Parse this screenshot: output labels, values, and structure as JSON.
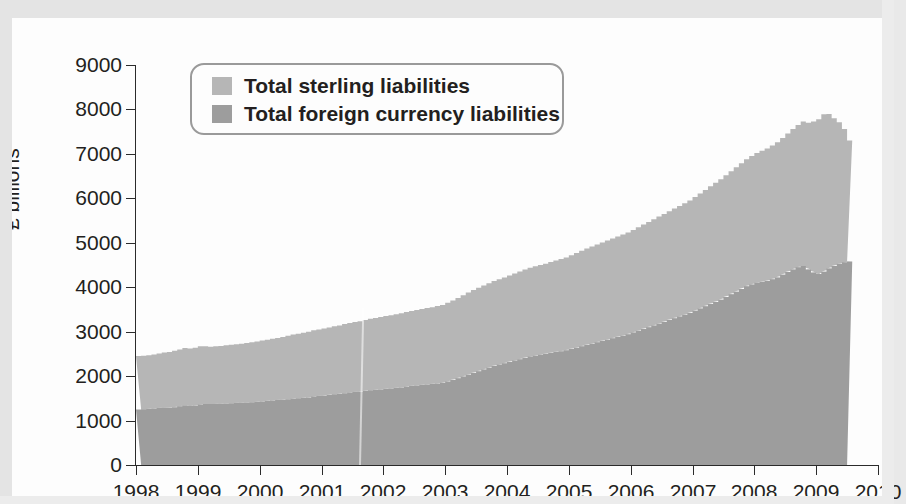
{
  "axes": {
    "y_title": "£ billions",
    "y_ticks": [
      "9000",
      "8000",
      "7000",
      "6000",
      "5000",
      "4000",
      "3000",
      "2000",
      "1000",
      "0"
    ],
    "x_ticks": [
      "1998",
      "1999",
      "2000",
      "2001",
      "2002",
      "2003",
      "2004",
      "2005",
      "2006",
      "2007",
      "2008",
      "2009",
      "2010"
    ]
  },
  "legend": {
    "items": [
      {
        "label": "Total sterling liabilities",
        "color": "#b6b6b6",
        "swatch_name": "legend-swatch-sterling"
      },
      {
        "label": "Total foreign currency liabilities",
        "color": "#9d9d9d",
        "swatch_name": "legend-swatch-foreign"
      }
    ]
  },
  "colors": {
    "sterling": "#b6b6b6",
    "foreign": "#9d9d9d",
    "axis": "#2b2b2b",
    "text": "#231f20",
    "card": "#fdfdfd",
    "page": "#e6e6e6",
    "legend_border": "#9a9a9a"
  },
  "chart_data": {
    "type": "area",
    "title": "",
    "subtitle": "",
    "xlabel": "",
    "ylabel": "£ billions",
    "xlim": [
      1998,
      2010
    ],
    "ylim": [
      0,
      9000
    ],
    "grid": false,
    "legend_position": "top-left",
    "stacked": true,
    "note": "Stacked monthly series; foreign currency liabilities drawn at bottom, sterling liabilities stacked above. Values in £ billions.",
    "x": [
      1998.0,
      1998.083,
      1998.167,
      1998.25,
      1998.333,
      1998.417,
      1998.5,
      1998.583,
      1998.667,
      1998.75,
      1998.833,
      1998.917,
      1999.0,
      1999.083,
      1999.167,
      1999.25,
      1999.333,
      1999.417,
      1999.5,
      1999.583,
      1999.667,
      1999.75,
      1999.833,
      1999.917,
      2000.0,
      2000.083,
      2000.167,
      2000.25,
      2000.333,
      2000.417,
      2000.5,
      2000.583,
      2000.667,
      2000.75,
      2000.833,
      2000.917,
      2001.0,
      2001.083,
      2001.167,
      2001.25,
      2001.333,
      2001.417,
      2001.5,
      2001.583,
      2001.667,
      2001.75,
      2001.833,
      2001.917,
      2002.0,
      2002.083,
      2002.167,
      2002.25,
      2002.333,
      2002.417,
      2002.5,
      2002.583,
      2002.667,
      2002.75,
      2002.833,
      2002.917,
      2003.0,
      2003.083,
      2003.167,
      2003.25,
      2003.333,
      2003.417,
      2003.5,
      2003.583,
      2003.667,
      2003.75,
      2003.833,
      2003.917,
      2004.0,
      2004.083,
      2004.167,
      2004.25,
      2004.333,
      2004.417,
      2004.5,
      2004.583,
      2004.667,
      2004.75,
      2004.833,
      2004.917,
      2005.0,
      2005.083,
      2005.167,
      2005.25,
      2005.333,
      2005.417,
      2005.5,
      2005.583,
      2005.667,
      2005.75,
      2005.833,
      2005.917,
      2006.0,
      2006.083,
      2006.167,
      2006.25,
      2006.333,
      2006.417,
      2006.5,
      2006.583,
      2006.667,
      2006.75,
      2006.833,
      2006.917,
      2007.0,
      2007.083,
      2007.167,
      2007.25,
      2007.333,
      2007.417,
      2007.5,
      2007.583,
      2007.667,
      2007.75,
      2007.833,
      2007.917,
      2008.0,
      2008.083,
      2008.167,
      2008.25,
      2008.333,
      2008.417,
      2008.5,
      2008.583,
      2008.667,
      2008.75,
      2008.833,
      2008.917,
      2009.0,
      2009.083,
      2009.167,
      2009.25,
      2009.333,
      2009.417,
      2009.5
    ],
    "series": [
      {
        "name": "Total foreign currency liabilities",
        "color": "#9d9d9d",
        "values": [
          1250,
          1255,
          1260,
          1270,
          1280,
          1290,
          1290,
          1300,
          1320,
          1340,
          1330,
          1340,
          1360,
          1370,
          1370,
          1375,
          1380,
          1385,
          1390,
          1395,
          1400,
          1405,
          1410,
          1420,
          1430,
          1440,
          1450,
          1460,
          1470,
          1480,
          1490,
          1500,
          1510,
          1520,
          1540,
          1550,
          1560,
          1575,
          1590,
          1600,
          1615,
          1630,
          1640,
          1650,
          1665,
          1680,
          1690,
          1700,
          1710,
          1720,
          1730,
          1745,
          1760,
          1775,
          1790,
          1800,
          1810,
          1820,
          1835,
          1850,
          1880,
          1910,
          1950,
          1990,
          2030,
          2070,
          2110,
          2150,
          2190,
          2230,
          2260,
          2290,
          2320,
          2350,
          2380,
          2410,
          2440,
          2460,
          2480,
          2500,
          2520,
          2540,
          2560,
          2580,
          2610,
          2640,
          2670,
          2700,
          2730,
          2760,
          2790,
          2820,
          2850,
          2880,
          2910,
          2940,
          2980,
          3020,
          3060,
          3100,
          3140,
          3180,
          3220,
          3260,
          3300,
          3340,
          3380,
          3420,
          3470,
          3520,
          3570,
          3620,
          3670,
          3720,
          3780,
          3840,
          3900,
          3960,
          4020,
          4060,
          4100,
          4120,
          4140,
          4180,
          4220,
          4280,
          4340,
          4400,
          4450,
          4480,
          4400,
          4330,
          4300,
          4350,
          4420,
          4480,
          4530,
          4560,
          4580
        ]
      },
      {
        "name": "Total sterling liabilities",
        "color": "#b6b6b6",
        "values": [
          1200,
          1205,
          1210,
          1215,
          1230,
          1240,
          1250,
          1270,
          1280,
          1290,
          1290,
          1300,
          1310,
          1300,
          1290,
          1295,
          1300,
          1310,
          1315,
          1320,
          1330,
          1340,
          1350,
          1360,
          1370,
          1380,
          1390,
          1400,
          1410,
          1430,
          1445,
          1455,
          1465,
          1480,
          1490,
          1500,
          1510,
          1520,
          1530,
          1540,
          1555,
          1565,
          1575,
          1585,
          1600,
          1610,
          1620,
          1630,
          1640,
          1650,
          1660,
          1670,
          1680,
          1690,
          1700,
          1710,
          1720,
          1730,
          1740,
          1750,
          1770,
          1790,
          1810,
          1830,
          1850,
          1870,
          1880,
          1890,
          1900,
          1910,
          1920,
          1930,
          1945,
          1960,
          1975,
          1990,
          2000,
          2010,
          2020,
          2030,
          2045,
          2060,
          2075,
          2090,
          2110,
          2130,
          2150,
          2170,
          2185,
          2200,
          2215,
          2230,
          2245,
          2260,
          2275,
          2290,
          2310,
          2330,
          2350,
          2370,
          2390,
          2410,
          2430,
          2450,
          2470,
          2490,
          2510,
          2530,
          2560,
          2590,
          2620,
          2650,
          2680,
          2710,
          2740,
          2770,
          2800,
          2830,
          2860,
          2890,
          2920,
          2950,
          2980,
          3010,
          3040,
          3080,
          3120,
          3160,
          3200,
          3250,
          3300,
          3400,
          3480,
          3540,
          3480,
          3320,
          3180,
          3000,
          2720
        ]
      }
    ]
  }
}
